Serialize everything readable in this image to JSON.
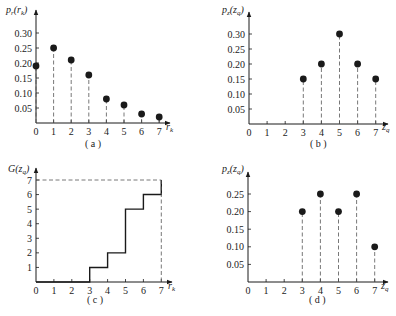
{
  "chart_data": [
    {
      "id": "a",
      "type": "scatter",
      "style": "stem",
      "caption": "( a )",
      "title": "",
      "xlabel": "r_k",
      "ylabel": "p_r(r_k)",
      "x": [
        0,
        1,
        2,
        3,
        4,
        5,
        6,
        7
      ],
      "values": [
        0.19,
        0.25,
        0.21,
        0.16,
        0.08,
        0.06,
        0.03,
        0.02
      ],
      "xticks": [
        "0",
        "1",
        "2",
        "3",
        "4",
        "5",
        "6",
        "7"
      ],
      "yticks": [
        "0.05",
        "0.10",
        "0.15",
        "0.20",
        "0.25",
        "0.30"
      ],
      "xlim": [
        0,
        7
      ],
      "ylim": [
        0,
        0.3
      ],
      "grid": false
    },
    {
      "id": "b",
      "type": "scatter",
      "style": "stem",
      "caption": "( b )",
      "title": "",
      "xlabel": "z_q",
      "ylabel": "p_z(z_q)",
      "x": [
        0,
        1,
        2,
        3,
        4,
        5,
        6,
        7
      ],
      "values": [
        0,
        0,
        0,
        0.15,
        0.2,
        0.3,
        0.2,
        0.15
      ],
      "xticks": [
        "0",
        "1",
        "2",
        "3",
        "4",
        "5",
        "6",
        "7"
      ],
      "yticks": [
        "0.05",
        "0.10",
        "0.15",
        "0.20",
        "0.25",
        "0.30"
      ],
      "xlim": [
        0,
        7
      ],
      "ylim": [
        0,
        0.3
      ],
      "grid": false
    },
    {
      "id": "c",
      "type": "line",
      "style": "step",
      "caption": "( c )",
      "title": "",
      "xlabel": "r_k",
      "ylabel": "G(z_q)",
      "x": [
        0,
        1,
        2,
        3,
        4,
        5,
        6,
        7
      ],
      "values": [
        0,
        0,
        0,
        1,
        2,
        5,
        6,
        7
      ],
      "xticks": [
        "0",
        "1",
        "2",
        "3",
        "4",
        "5",
        "6",
        "7"
      ],
      "yticks": [
        "1",
        "2",
        "3",
        "4",
        "5",
        "6",
        "7"
      ],
      "xlim": [
        0,
        7
      ],
      "ylim": [
        0,
        7
      ],
      "annotations": [
        "dashed guide lines at y=7 and x=7"
      ],
      "grid": false
    },
    {
      "id": "d",
      "type": "scatter",
      "style": "stem",
      "caption": "( d )",
      "title": "",
      "xlabel": "z_q",
      "ylabel": "p_z(z_q)",
      "x": [
        0,
        1,
        2,
        3,
        4,
        5,
        6,
        7
      ],
      "values": [
        0,
        0,
        0,
        0.2,
        0.25,
        0.2,
        0.25,
        0.1
      ],
      "xticks": [
        "0",
        "1",
        "2",
        "3",
        "4",
        "5",
        "6",
        "7"
      ],
      "yticks": [
        "0.05",
        "0.10",
        "0.15",
        "0.20",
        "0.25"
      ],
      "xlim": [
        0,
        7
      ],
      "ylim": [
        0,
        0.25
      ],
      "grid": false
    }
  ],
  "labels": {
    "a": {
      "ylabel_main": "p",
      "ylabel_sub": "r",
      "ylabel_arg": "(r",
      "ylabel_arg_sub": "k",
      "ylabel_close": ")",
      "xlabel_main": "r",
      "xlabel_sub": "k",
      "caption": "( a )"
    },
    "b": {
      "ylabel_main": "p",
      "ylabel_sub": "z",
      "ylabel_arg": "(z",
      "ylabel_arg_sub": "q",
      "ylabel_close": ")",
      "xlabel_main": "z",
      "xlabel_sub": "q",
      "caption": "( b )"
    },
    "c": {
      "ylabel_main": "G",
      "ylabel_arg": "(z",
      "ylabel_arg_sub": "q",
      "ylabel_close": ")",
      "xlabel_main": "r",
      "xlabel_sub": "k",
      "caption": "( c )"
    },
    "d": {
      "ylabel_main": "p",
      "ylabel_sub": "z",
      "ylabel_arg": "(z",
      "ylabel_arg_sub": "q",
      "ylabel_close": ")",
      "xlabel_main": "z",
      "xlabel_sub": "q",
      "caption": "( d )"
    }
  },
  "colors": {
    "ink": "#1a1a1a",
    "dash": "#555555",
    "background": "#ffffff"
  }
}
